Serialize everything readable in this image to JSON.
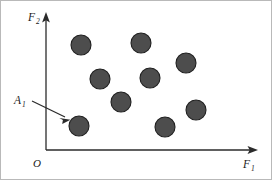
{
  "figure": {
    "name": "objective-space-scatter",
    "width": 272,
    "height": 180,
    "background_color": "#ffffff",
    "border_color": "#b9b9b9"
  },
  "axes": {
    "x": {
      "label_base": "F",
      "label_subscript": "1",
      "label_text": "F1",
      "origin_px": [
        46,
        150
      ],
      "end_px": [
        257,
        150
      ],
      "arrow": true,
      "color": "#2b2b2b"
    },
    "y": {
      "label_base": "F",
      "label_subscript": "2",
      "label_text": "F2",
      "origin_px": [
        46,
        150
      ],
      "end_px": [
        46,
        14
      ],
      "arrow": true,
      "color": "#2b2b2b"
    },
    "origin": {
      "label": "O",
      "px": [
        37,
        163
      ]
    }
  },
  "annotation": {
    "label_base": "A",
    "label_subscript": "1",
    "label_text": "A1",
    "label_px": [
      16,
      102
    ],
    "arrow_start_px": [
      32,
      102
    ],
    "arrow_end_px": [
      70,
      121
    ],
    "target_point_index": 6,
    "color": "#2b2b2b"
  },
  "chart_data": {
    "type": "scatter",
    "title": "",
    "subtitle": "",
    "xlabel": "F1",
    "ylabel": "F2",
    "grid": false,
    "legend": null,
    "axis_arrows": true,
    "point_style": {
      "shape": "circle",
      "radius_px": 10,
      "fill": "#4d4d4d",
      "stroke": "#1f1f1f"
    },
    "annotations": [
      {
        "text": "A1",
        "points_to_index": 6
      }
    ],
    "points_px": [
      {
        "cx": 81,
        "cy": 45,
        "r": 10
      },
      {
        "cx": 141,
        "cy": 43,
        "r": 10
      },
      {
        "cx": 186,
        "cy": 63,
        "r": 10
      },
      {
        "cx": 100,
        "cy": 79,
        "r": 10
      },
      {
        "cx": 150,
        "cy": 78,
        "r": 10
      },
      {
        "cx": 121,
        "cy": 102,
        "r": 10
      },
      {
        "cx": 79,
        "cy": 126,
        "r": 10
      },
      {
        "cx": 165,
        "cy": 127,
        "r": 10
      },
      {
        "cx": 196,
        "cy": 110,
        "r": 10
      }
    ],
    "n_points": 9
  }
}
